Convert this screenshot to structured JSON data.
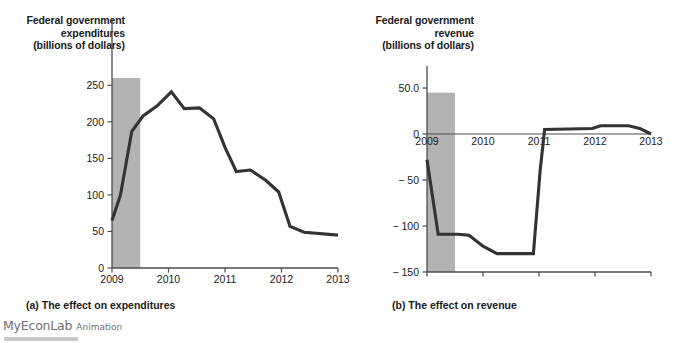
{
  "figure": {
    "panels": [
      {
        "id": "a",
        "caption": "(a) The effect on expenditures",
        "axis_title_lines": [
          "Federal government",
          "expenditures",
          "(billions of dollars)"
        ]
      },
      {
        "id": "b",
        "caption": "(b) The effect on revenue",
        "axis_title_lines": [
          "Federal government",
          "revenue",
          "(billions of dollars)"
        ]
      }
    ]
  },
  "branding": {
    "name": "MyEconLab",
    "suffix": "Animation"
  },
  "colors": {
    "line": "#333333",
    "recession_band": "#b3b3b3",
    "axis": "#4d4d4d",
    "text": "#1a1a1a",
    "brand_text": "#6e6e73"
  },
  "chart_data": [
    {
      "type": "line",
      "panel": "a",
      "title": "Federal government expenditures (billions of dollars)",
      "caption": "(a) The effect on expenditures",
      "xlabel": "",
      "ylabel": "Federal government expenditures (billions of dollars)",
      "xlim": [
        2009.0,
        2013.0
      ],
      "ylim": [
        0,
        275
      ],
      "yticks": [
        0,
        50,
        100,
        150,
        200,
        250
      ],
      "ytick_labels": [
        "0",
        "50",
        "100",
        "150",
        "200",
        "250"
      ],
      "xticks": [
        2009,
        2010,
        2011,
        2012,
        2013
      ],
      "xtick_labels": [
        "2009",
        "2010",
        "2011",
        "2012",
        "2013"
      ],
      "grid": false,
      "legend": "none",
      "annotations": [
        {
          "type": "shaded_band",
          "label": "recession",
          "x_start": 2009.0,
          "x_end": 2009.5,
          "y_top": 260
        }
      ],
      "x": [
        2009.0,
        2009.15,
        2009.35,
        2009.55,
        2009.8,
        2010.05,
        2010.28,
        2010.55,
        2010.8,
        2011.0,
        2011.2,
        2011.45,
        2011.72,
        2011.95,
        2012.15,
        2012.4,
        2013.0
      ],
      "values": [
        65,
        100,
        187,
        208,
        222,
        241,
        218,
        219,
        204,
        165,
        132,
        134,
        120,
        104,
        57,
        49,
        45
      ]
    },
    {
      "type": "line",
      "panel": "b",
      "title": "Federal government revenue (billions of dollars)",
      "caption": "(b) The effect on revenue",
      "xlabel": "",
      "ylabel": "Federal government revenue (billions of dollars)",
      "xlim": [
        2009.0,
        2013.0
      ],
      "ylim": [
        -150,
        50
      ],
      "yticks": [
        50,
        0,
        -50,
        -100,
        -150
      ],
      "ytick_labels": [
        "50.0",
        "0",
        "− 50",
        "− 100",
        "− 150"
      ],
      "xticks": [
        2009,
        2010,
        2011,
        2012,
        2013
      ],
      "xtick_labels": [
        "2009",
        "2010",
        "2011",
        "2012",
        "2013"
      ],
      "grid": false,
      "legend": "none",
      "annotations": [
        {
          "type": "shaded_band",
          "label": "recession",
          "x_start": 2009.0,
          "x_end": 2009.5,
          "y_top": 45
        },
        {
          "type": "zero_line",
          "y": 0
        }
      ],
      "x": [
        2009.0,
        2009.2,
        2009.55,
        2009.75,
        2010.0,
        2010.25,
        2010.9,
        2011.02,
        2011.1,
        2011.95,
        2012.1,
        2012.6,
        2012.8,
        2013.0
      ],
      "values": [
        -28,
        -109,
        -109,
        -110,
        -122,
        -130,
        -130,
        -40,
        5,
        6,
        9,
        9,
        6,
        0
      ]
    }
  ]
}
